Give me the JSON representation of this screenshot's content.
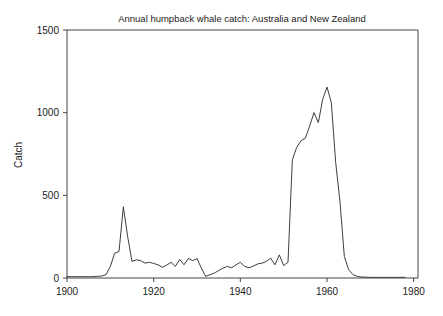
{
  "chart_data": {
    "type": "line",
    "title": "Annual humpback whale catch: Australia and New Zealand",
    "xlabel": "",
    "ylabel": "Catch",
    "xlim": [
      1900,
      1981
    ],
    "ylim": [
      0,
      1500
    ],
    "xticks": [
      1900,
      1920,
      1940,
      1960,
      1980
    ],
    "xtick_labels": [
      "1900",
      "1920",
      "1940",
      "1960",
      "1980"
    ],
    "yticks": [
      0,
      500,
      1000,
      1500
    ],
    "ytick_labels": [
      "0",
      "500",
      "1000",
      "1500"
    ],
    "grid": false,
    "legend": false,
    "line_color": "#3d3d3d",
    "axis_color": "#444444",
    "series": [
      {
        "name": "Catch",
        "x": [
          1900,
          1901,
          1902,
          1903,
          1904,
          1905,
          1906,
          1907,
          1908,
          1909,
          1910,
          1911,
          1912,
          1913,
          1914,
          1915,
          1916,
          1917,
          1918,
          1919,
          1920,
          1921,
          1922,
          1923,
          1924,
          1925,
          1926,
          1927,
          1928,
          1929,
          1930,
          1931,
          1932,
          1933,
          1934,
          1935,
          1936,
          1937,
          1938,
          1939,
          1940,
          1941,
          1942,
          1943,
          1944,
          1945,
          1946,
          1947,
          1948,
          1949,
          1950,
          1951,
          1952,
          1953,
          1954,
          1955,
          1956,
          1957,
          1958,
          1959,
          1960,
          1961,
          1962,
          1963,
          1964,
          1965,
          1966,
          1967,
          1968,
          1969,
          1970,
          1971,
          1972,
          1973,
          1974,
          1975,
          1976,
          1977,
          1978
        ],
        "values": [
          8,
          8,
          8,
          8,
          8,
          8,
          8,
          10,
          12,
          20,
          70,
          150,
          160,
          431,
          250,
          100,
          110,
          105,
          90,
          95,
          88,
          80,
          65,
          78,
          95,
          70,
          112,
          80,
          118,
          105,
          118,
          60,
          10,
          20,
          30,
          45,
          60,
          70,
          62,
          80,
          95,
          70,
          62,
          72,
          85,
          90,
          100,
          120,
          80,
          140,
          75,
          95,
          715,
          790,
          830,
          845,
          920,
          1000,
          940,
          1080,
          1155,
          1060,
          700,
          460,
          130,
          50,
          20,
          10,
          6,
          5,
          4,
          4,
          4,
          4,
          4,
          4,
          4,
          4,
          4
        ]
      }
    ]
  },
  "axes": {
    "ylabel_text": "Catch"
  }
}
